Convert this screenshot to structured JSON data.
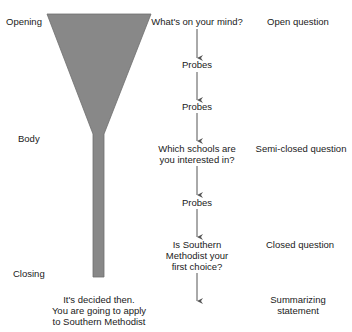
{
  "colors": {
    "funnel": "#888888",
    "funnel_edge": "#6e6e6e",
    "arrow": "#555555",
    "text": "#1a1a1a"
  },
  "phases": {
    "opening": "Opening",
    "body": "Body",
    "closing": "Closing"
  },
  "flow": {
    "q1": "What's on your mind?",
    "probe1": "Probes",
    "probe2": "Probes",
    "q2_line1": "Which schools are",
    "q2_line2": "you interested in?",
    "probe3": "Probes",
    "q3_line1": "Is Southern",
    "q3_line2": "Methodist your",
    "q3_line3": "first choice?",
    "closing_line1": "It's decided then.",
    "closing_line2": "You are going to apply",
    "closing_line3": "to Southern Methodist"
  },
  "types": {
    "open": "Open question",
    "semi_closed": "Semi-closed question",
    "closed": "Closed question",
    "summ_line1": "Summarizing",
    "summ_line2": "statement"
  }
}
